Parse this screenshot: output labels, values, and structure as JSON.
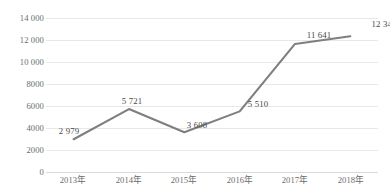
{
  "chart_data": {
    "type": "line",
    "title": "",
    "subtitle": "",
    "xlabel": "",
    "ylabel": "",
    "categories": [
      "2013年",
      "2014年",
      "2015年",
      "2016年",
      "2017年",
      "2018年"
    ],
    "values": [
      2979,
      5721,
      3608,
      5510,
      11641,
      12344
    ],
    "data_labels": [
      "2 979",
      "5 721",
      "3 608",
      "5 510",
      "11 641",
      "12 344"
    ],
    "ylim": [
      0,
      14000
    ],
    "ytick_step": 2000,
    "ytick_values": [
      14000,
      12000,
      10000,
      8000,
      6000,
      4000,
      2000,
      0
    ],
    "ytick_labels": [
      "14 000",
      "12 000",
      "10 000",
      "8000",
      "6000",
      "4000",
      "2000",
      "0"
    ],
    "grid": true,
    "grid_axis": "y",
    "legend": false,
    "legend_position": "none",
    "series": [
      {
        "name": "",
        "values": [
          2979,
          5721,
          3608,
          5510,
          11641,
          12344
        ],
        "color": "#7f7f7f",
        "line_width": 2.1,
        "markers": false
      }
    ],
    "colors": {
      "line": "#7f7f7f",
      "gridline": "#e8e8e8",
      "baseline": "#dadada",
      "tick_text": "#6b6b6b",
      "label_text": "#4a4a4a",
      "background": "#ffffff"
    },
    "annotations": []
  }
}
